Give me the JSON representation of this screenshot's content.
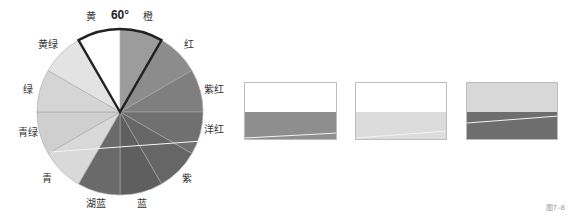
{
  "wheel": {
    "angle_label": "60°",
    "center": [
      120,
      112
    ],
    "radius": 83,
    "segments": [
      {
        "name": "橙",
        "start": 0,
        "end": 30,
        "color": "#9c9c9c",
        "label_pos": [
          148,
          17
        ]
      },
      {
        "name": "红",
        "start": 30,
        "end": 60,
        "color": "#8c8c8c",
        "label_pos": [
          189,
          45
        ]
      },
      {
        "name": "紫红",
        "start": 60,
        "end": 90,
        "color": "#7f7f7f",
        "label_pos": [
          214,
          90
        ]
      },
      {
        "name": "洋红",
        "start": 90,
        "end": 120,
        "color": "#707070",
        "label_pos": [
          214,
          130
        ]
      },
      {
        "name": "紫",
        "start": 120,
        "end": 150,
        "color": "#666666",
        "label_pos": [
          187,
          179
        ]
      },
      {
        "name": "蓝",
        "start": 150,
        "end": 180,
        "color": "#5f5f5f",
        "label_pos": [
          142,
          204
        ]
      },
      {
        "name": "湖蓝",
        "start": 180,
        "end": 210,
        "color": "#6a6a6a",
        "label_pos": [
          96,
          204
        ]
      },
      {
        "name": "青",
        "start": 210,
        "end": 240,
        "color": "#d9d9d9",
        "label_pos": [
          47,
          179
        ]
      },
      {
        "name": "青绿",
        "start": 240,
        "end": 270,
        "color": "#cfcfcf",
        "label_pos": [
          28,
          133
        ]
      },
      {
        "name": "绿",
        "start": 270,
        "end": 300,
        "color": "#d5d5d5",
        "label_pos": [
          28,
          90
        ]
      },
      {
        "name": "黄绿",
        "start": 300,
        "end": 330,
        "color": "#e3e3e3",
        "label_pos": [
          48,
          45
        ]
      },
      {
        "name": "黄",
        "start": 330,
        "end": 360,
        "color": "#ffffff",
        "label_pos": [
          91,
          17
        ]
      }
    ],
    "highlight": {
      "start": -30,
      "end": 30,
      "stroke": "#222222"
    },
    "white_line": [
      [
        50,
        152
      ],
      [
        202,
        141
      ]
    ]
  },
  "swatches": [
    {
      "x": 244,
      "y": 82,
      "w": 93,
      "h": 58,
      "split": 29,
      "top": "#ffffff",
      "bottom": "#8e8e8e",
      "line": [
        [
          0,
          55
        ],
        [
          93,
          50
        ]
      ]
    },
    {
      "x": 355,
      "y": 82,
      "w": 92,
      "h": 58,
      "split": 29,
      "top": "#ffffff",
      "bottom": "#dcdcdc",
      "line": [
        [
          0,
          55
        ],
        [
          92,
          48
        ]
      ]
    },
    {
      "x": 466,
      "y": 82,
      "w": 92,
      "h": 58,
      "split": 29,
      "top": "#d8d8d8",
      "bottom": "#6e6e6e",
      "line": [
        [
          0,
          40
        ],
        [
          92,
          33
        ]
      ]
    }
  ],
  "caption": "图7–8"
}
